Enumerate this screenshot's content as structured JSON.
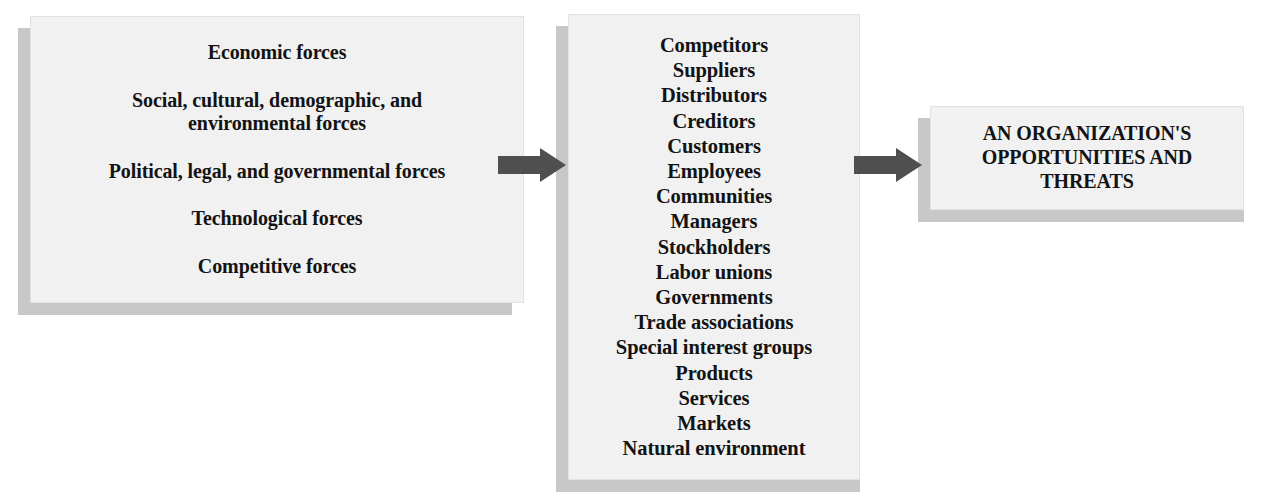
{
  "diagram": {
    "background_color": "#ffffff",
    "box_fill_color": "#f1f1f1",
    "box_shadow_color": "#c8c8c8",
    "arrow_color": "#4f4f4f",
    "text_color": "#131313"
  },
  "external_forces_box": {
    "name": "External forces",
    "lines": [
      "Economic forces",
      "Social, cultural, demographic, and environmental forces",
      "Political, legal, and governmental forces",
      "Technological forces",
      "Competitive forces"
    ]
  },
  "stakeholders_box": {
    "name": "Stakeholders and environment",
    "items": [
      "Competitors",
      "Suppliers",
      "Distributors",
      "Creditors",
      "Customers",
      "Employees",
      "Communities",
      "Managers",
      "Stockholders",
      "Labor unions",
      "Governments",
      "Trade associations",
      "Special interest groups",
      "Products",
      "Services",
      "Markets",
      "Natural environment"
    ]
  },
  "outcome_box": {
    "name": "Outcome",
    "lines": [
      "AN ORGANIZATION'S",
      "OPPORTUNITIES AND",
      "THREATS"
    ]
  },
  "arrows": [
    {
      "label": "arrow from external forces to stakeholders",
      "direction": "right"
    },
    {
      "label": "arrow from stakeholders to outcome",
      "direction": "right"
    }
  ]
}
